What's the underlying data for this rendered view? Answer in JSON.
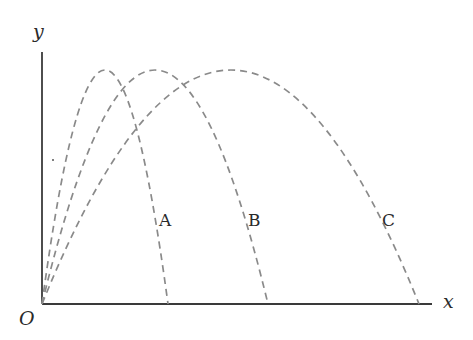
{
  "diagram": {
    "type": "projectile-trajectories",
    "axes": {
      "x_label": "x",
      "y_label": "y",
      "origin_label": "O"
    },
    "trajectories": [
      {
        "label": "A",
        "peak_x_frac": 0.5,
        "range_px": 126,
        "peak_height_px": 234
      },
      {
        "label": "B",
        "peak_x_frac": 0.5,
        "range_px": 226,
        "peak_height_px": 234
      },
      {
        "label": "C",
        "peak_x_frac": 0.5,
        "range_px": 377,
        "peak_height_px": 234
      }
    ],
    "colors": {
      "axis": "#3a3a3a",
      "trajectory": "#8a8a8a",
      "text": "#2a2a2a",
      "background": "#ffffff"
    }
  }
}
